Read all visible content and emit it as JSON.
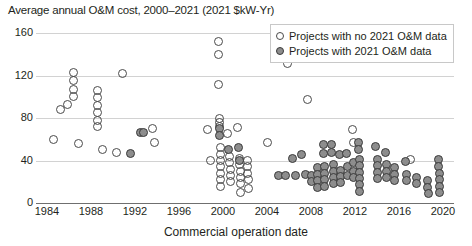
{
  "chart_data": {
    "type": "scatter",
    "title": "Average annual O&M cost, 2000–2021 (2021 $kW-Yr)",
    "xlabel": "Commercial operation date",
    "ylabel": "",
    "xlim": [
      1983,
      2021
    ],
    "ylim": [
      0,
      160
    ],
    "grid": true,
    "legend_position": "top-right",
    "yticks": [
      0,
      40,
      80,
      120,
      160
    ],
    "xticks": [
      1984,
      1988,
      1992,
      1996,
      2000,
      2004,
      2008,
      2012,
      2016,
      2020
    ],
    "series": [
      {
        "name": "Projects with no 2021 O&M data",
        "marker": "open-circle",
        "color": "#4a4a4a",
        "points": [
          [
            1984.6,
            60
          ],
          [
            1985.2,
            88
          ],
          [
            1985.9,
            93
          ],
          [
            1986.4,
            123
          ],
          [
            1986.4,
            115
          ],
          [
            1986.4,
            107
          ],
          [
            1986.4,
            100
          ],
          [
            1986.9,
            56
          ],
          [
            1988.6,
            106
          ],
          [
            1988.6,
            99
          ],
          [
            1988.6,
            92
          ],
          [
            1988.6,
            85
          ],
          [
            1988.6,
            78
          ],
          [
            1988.6,
            72
          ],
          [
            1989.0,
            50
          ],
          [
            1990.3,
            48
          ],
          [
            1990.9,
            122
          ],
          [
            1993.6,
            70
          ],
          [
            1993.8,
            57
          ],
          [
            1998.6,
            69
          ],
          [
            1998.9,
            40
          ],
          [
            1999.6,
            152
          ],
          [
            1999.6,
            140
          ],
          [
            1999.6,
            112
          ],
          [
            1999.7,
            80
          ],
          [
            1999.7,
            76
          ],
          [
            1999.7,
            72
          ],
          [
            1999.8,
            52
          ],
          [
            1999.8,
            46
          ],
          [
            1999.8,
            40
          ],
          [
            1999.8,
            34
          ],
          [
            1999.8,
            28
          ],
          [
            1999.8,
            22
          ],
          [
            1999.8,
            16
          ],
          [
            2000.4,
            65
          ],
          [
            2000.6,
            44
          ],
          [
            2000.6,
            38
          ],
          [
            2000.7,
            32
          ],
          [
            2000.7,
            26
          ],
          [
            2000.7,
            20
          ],
          [
            2001.3,
            71
          ],
          [
            2001.5,
            42
          ],
          [
            2001.5,
            36
          ],
          [
            2001.6,
            30
          ],
          [
            2001.6,
            24
          ],
          [
            2001.6,
            18
          ],
          [
            2001.6,
            10
          ],
          [
            2002.2,
            40
          ],
          [
            2002.2,
            34
          ],
          [
            2002.2,
            28
          ],
          [
            2002.3,
            22
          ],
          [
            2002.3,
            14
          ],
          [
            2004.0,
            57
          ],
          [
            2005.9,
            131
          ],
          [
            2007.7,
            97
          ],
          [
            2011.8,
            69
          ],
          [
            2011.9,
            57
          ],
          [
            2017.0,
            41
          ]
        ]
      },
      {
        "name": "Projects with 2021 O&M data",
        "marker": "filled-circle",
        "color": "#8d8d8d",
        "points": [
          [
            1991.6,
            47
          ],
          [
            1992.5,
            66
          ],
          [
            1992.8,
            66
          ],
          [
            1999.7,
            70
          ],
          [
            1999.7,
            64
          ],
          [
            2000.5,
            50
          ],
          [
            2001.4,
            52
          ],
          [
            2001.5,
            40
          ],
          [
            2005.0,
            26
          ],
          [
            2005.7,
            26
          ],
          [
            2006.3,
            42
          ],
          [
            2006.6,
            26
          ],
          [
            2007.1,
            46
          ],
          [
            2007.5,
            27
          ],
          [
            2008.0,
            26
          ],
          [
            2008.0,
            20
          ],
          [
            2008.6,
            33
          ],
          [
            2008.6,
            27
          ],
          [
            2008.6,
            21
          ],
          [
            2008.6,
            15
          ],
          [
            2009.1,
            55
          ],
          [
            2009.1,
            47
          ],
          [
            2009.2,
            34
          ],
          [
            2009.2,
            28
          ],
          [
            2009.2,
            22
          ],
          [
            2009.2,
            16
          ],
          [
            2009.9,
            55
          ],
          [
            2009.9,
            48
          ],
          [
            2010.0,
            36
          ],
          [
            2010.0,
            30
          ],
          [
            2010.0,
            24
          ],
          [
            2010.0,
            18
          ],
          [
            2010.6,
            46
          ],
          [
            2010.7,
            31
          ],
          [
            2010.7,
            25
          ],
          [
            2010.7,
            19
          ],
          [
            2011.2,
            47
          ],
          [
            2011.3,
            34
          ],
          [
            2011.3,
            26
          ],
          [
            2011.9,
            38
          ],
          [
            2011.9,
            30
          ],
          [
            2011.9,
            24
          ],
          [
            2012.3,
            57
          ],
          [
            2012.3,
            50
          ],
          [
            2012.4,
            41
          ],
          [
            2012.4,
            35
          ],
          [
            2012.4,
            29
          ],
          [
            2012.4,
            23
          ],
          [
            2012.4,
            17
          ],
          [
            2012.4,
            11
          ],
          [
            2013.9,
            53
          ],
          [
            2014.0,
            41
          ],
          [
            2014.0,
            35
          ],
          [
            2014.0,
            29
          ],
          [
            2014.0,
            23
          ],
          [
            2014.8,
            48
          ],
          [
            2014.9,
            36
          ],
          [
            2014.9,
            30
          ],
          [
            2014.9,
            24
          ],
          [
            2015.6,
            33
          ],
          [
            2015.6,
            27
          ],
          [
            2015.6,
            21
          ],
          [
            2016.6,
            39
          ],
          [
            2016.7,
            27
          ],
          [
            2016.7,
            21
          ],
          [
            2017.6,
            24
          ],
          [
            2017.6,
            18
          ],
          [
            2018.6,
            21
          ],
          [
            2018.6,
            15
          ],
          [
            2018.7,
            9
          ],
          [
            2019.6,
            41
          ],
          [
            2019.6,
            34
          ],
          [
            2019.7,
            28
          ],
          [
            2019.7,
            22
          ],
          [
            2019.7,
            16
          ],
          [
            2019.7,
            10
          ]
        ]
      }
    ]
  }
}
